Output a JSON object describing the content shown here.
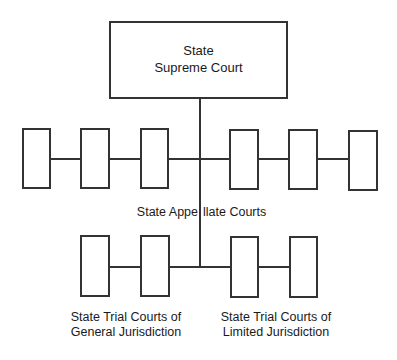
{
  "diagram": {
    "type": "org-chart",
    "title_node": {
      "line1": "State",
      "line2": "Supreme Court"
    },
    "appellate": {
      "label_left": "State Appe",
      "label_right": "llate Courts",
      "label_full": "State Appellate Courts",
      "box_count": 6
    },
    "trial_general": {
      "line1": "State Trial Courts of",
      "line2": "General Jurisdiction",
      "box_count": 2
    },
    "trial_limited": {
      "line1": "State Trial Courts of",
      "line2": "Limited Jurisdiction",
      "box_count": 2
    },
    "colors": {
      "line": "#333333",
      "text": "#1a1a1a",
      "background": "#ffffff"
    }
  }
}
